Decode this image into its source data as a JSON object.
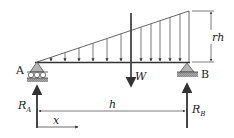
{
  "diagram": {
    "labels": {
      "support_a": "A",
      "support_b": "B",
      "resultant": "W",
      "load_height": "rh",
      "span": "h",
      "position": "x",
      "reaction_a_main": "R",
      "reaction_a_sub": "A",
      "reaction_b_main": "R",
      "reaction_b_sub": "B"
    },
    "colors": {
      "line": "#333333",
      "support_fill": "#b5b5b5",
      "ground": "#8a8a8a",
      "background": "#ffffff"
    },
    "load": {
      "type": "triangular",
      "arrow_count": 11
    }
  }
}
